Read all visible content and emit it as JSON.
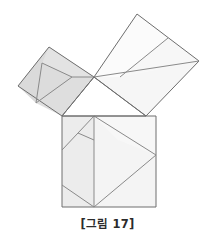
{
  "figure": {
    "caption": "[그림 17]",
    "canvas": {
      "width": 215,
      "height": 244
    },
    "colors": {
      "background": "#ffffff",
      "stroke": "#8a8a8a",
      "stroke_dark": "#6e6e6e",
      "fill_light": "#fbfbfb",
      "fill_mid": "#f2f2f2",
      "fill_gray": "#e6e6e6",
      "fill_dark_gray": "#d9d9d9",
      "caption_color": "#2b2b2b"
    },
    "stroke_width": 1,
    "triangle": {
      "name": "right-triangle",
      "vertices": [
        {
          "label": "A",
          "x": 94,
          "y": 77
        },
        {
          "label": "B",
          "x": 62,
          "y": 116
        },
        {
          "label": "C",
          "x": 146,
          "y": 116
        }
      ]
    },
    "squares": [
      {
        "name": "square-on-left-leg",
        "shade": "dark",
        "fill": "#d9d9d9",
        "points": "94,77 62,116 18,86 49,47"
      },
      {
        "name": "square-on-hypotenuse",
        "shade": "light",
        "fill": "#fbfbfb",
        "points": "94,77 146,116 199,61 137,14"
      },
      {
        "name": "square-on-bottom-side",
        "shade": "mid",
        "fill": "#f4f4f4",
        "points": "62,116 156,116 156,207 62,207"
      }
    ],
    "pieces": [
      {
        "name": "piece-left-square-far",
        "fill": "#dadada",
        "points": "18,86 49,47 42,63 36,103"
      },
      {
        "name": "piece-left-square-upper",
        "fill": "#e3e3e3",
        "points": "49,47 94,77 72,77 42,63"
      },
      {
        "name": "piece-left-square-inner-upper",
        "fill": "#dcdcdc",
        "points": "42,63 72,77 36,103"
      },
      {
        "name": "piece-left-square-lower",
        "fill": "#dedede",
        "points": "36,103 72,77 94,77 62,116"
      },
      {
        "name": "piece-hyp-square-upper-left",
        "fill": "#fbfbfb",
        "points": "94,77 137,14 168,38 120,77"
      },
      {
        "name": "piece-hyp-square-upper-right",
        "fill": "#f7f7f7",
        "points": "168,38 199,61 120,77"
      },
      {
        "name": "piece-hyp-square-lower",
        "fill": "#f6f6f6",
        "points": "94,77 120,77 199,61 146,116"
      },
      {
        "name": "piece-bottom-left-strip",
        "fill": "#ececec",
        "points": "62,116 94,116 94,207 62,207"
      },
      {
        "name": "piece-bottom-right-upper",
        "fill": "#f7f7f7",
        "points": "94,116 156,116 156,155 118,140"
      },
      {
        "name": "piece-bottom-right-lower",
        "fill": "#f4f4f4",
        "points": "94,207 156,155 156,207"
      }
    ],
    "internal_lines": [
      {
        "name": "left-square-line-1",
        "x1": 42,
        "y1": 63,
        "x2": 36,
        "y2": 103
      },
      {
        "name": "left-square-line-2",
        "x1": 42,
        "y1": 63,
        "x2": 72,
        "y2": 77
      },
      {
        "name": "left-square-line-3",
        "x1": 36,
        "y1": 103,
        "x2": 72,
        "y2": 77
      },
      {
        "name": "left-square-line-4",
        "x1": 72,
        "y1": 77,
        "x2": 94,
        "y2": 77
      },
      {
        "name": "hyp-square-line-1",
        "x1": 168,
        "y1": 38,
        "x2": 120,
        "y2": 77
      },
      {
        "name": "hyp-square-line-2",
        "x1": 94,
        "y1": 77,
        "x2": 199,
        "y2": 61
      },
      {
        "name": "bottom-square-line-vertical",
        "x1": 94,
        "y1": 116,
        "x2": 94,
        "y2": 207
      },
      {
        "name": "bottom-square-line-diag-upper",
        "x1": 62,
        "y1": 150,
        "x2": 94,
        "y2": 116
      },
      {
        "name": "bottom-square-line-diag-short",
        "x1": 78,
        "y1": 133,
        "x2": 94,
        "y2": 140
      },
      {
        "name": "bottom-square-line-diag-lower",
        "x1": 62,
        "y1": 185,
        "x2": 94,
        "y2": 207
      },
      {
        "name": "bottom-square-line-diag-right",
        "x1": 94,
        "y1": 207,
        "x2": 156,
        "y2": 155
      },
      {
        "name": "bottom-square-line-diag-top-right",
        "x1": 94,
        "y1": 116,
        "x2": 156,
        "y2": 155
      }
    ]
  }
}
